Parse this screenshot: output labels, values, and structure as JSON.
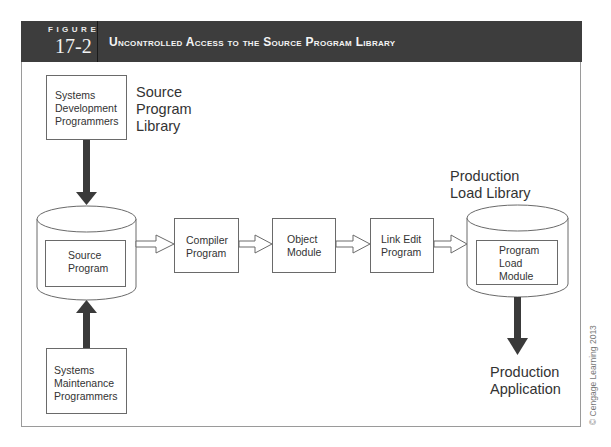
{
  "figure": {
    "label": "FIGURE",
    "number": "17-2",
    "title": "Uncontrolled Access to the Source Program Library"
  },
  "diagram": {
    "dev_programmers": [
      "Systems",
      "Development",
      "Programmers"
    ],
    "source_library_label": [
      "Source",
      "Program",
      "Library"
    ],
    "source_program": [
      "Source",
      "Program"
    ],
    "maint_programmers": [
      "Systems",
      "Maintenance",
      "Programmers"
    ],
    "compiler": [
      "Compiler",
      "Program"
    ],
    "object_module": [
      "Object",
      "Module"
    ],
    "link_edit": [
      "Link Edit",
      "Program"
    ],
    "production_library_label": [
      "Production",
      "Load Library"
    ],
    "load_module": [
      "Program",
      "Load",
      "Module"
    ],
    "production_application": [
      "Production",
      "Application"
    ]
  },
  "copyright": "© Cengage Learning 2013",
  "colors": {
    "header_bg": "#3d3d3d",
    "arrow_dark": "#3a3a3a",
    "line": "#6a6a6a"
  }
}
